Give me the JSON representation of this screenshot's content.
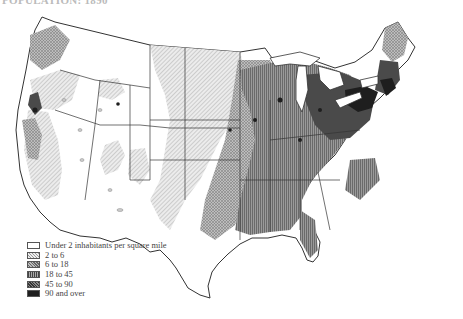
{
  "title": "POPULATION: 1890",
  "map": {
    "subject": "Population density of the United States",
    "region": "Contiguous United States",
    "style": "monochrome hatched choropleth"
  },
  "legend": {
    "items": [
      {
        "label": "Under 2 inhabitants per square mile",
        "pattern": "blank",
        "color": "#ffffff"
      },
      {
        "label": "2 to 6",
        "pattern": "diagonal-light",
        "color": "#d8d8d8"
      },
      {
        "label": "6 to 18",
        "pattern": "cross-hatch",
        "color": "#a8a8a8"
      },
      {
        "label": "18 to 45",
        "pattern": "vertical-lines",
        "color": "#858585"
      },
      {
        "label": "45 to 90",
        "pattern": "dense-cross",
        "color": "#5a5a5a"
      },
      {
        "label": "90 and over",
        "pattern": "solid",
        "color": "#1e1e1e"
      }
    ]
  }
}
